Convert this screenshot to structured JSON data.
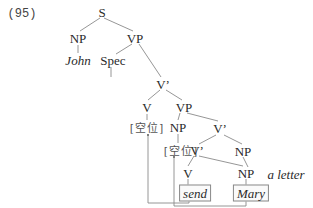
{
  "example_number": "(95)",
  "tree": {
    "S": "S",
    "NP_subject": "NP",
    "VP_top": "VP",
    "John": "John",
    "Spec": "Spec",
    "Vbar_1": "V’",
    "V_upper": "V",
    "VP_inner": "VP",
    "empty_1": "[空位]",
    "NP_inner": "NP",
    "Vbar_2": "V’",
    "empty_2": "[空位]",
    "Vbar_3": "V’",
    "NP_object2": "NP",
    "V_lower": "V",
    "NP_lower": "NP",
    "a_letter": "a letter",
    "send": "send",
    "Mary": "Mary"
  },
  "colors": {
    "line": "#8a8a8a",
    "text": "#2a2a2a",
    "cjk": "#555555"
  }
}
